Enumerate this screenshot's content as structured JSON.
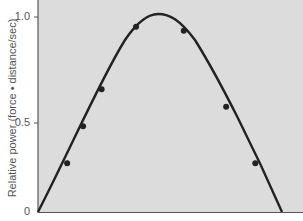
{
  "chart_data": {
    "type": "line",
    "title": "",
    "xlabel": "",
    "ylabel": "Relative power (force • distance/sec)",
    "ylim": [
      0,
      1.0
    ],
    "yticks": [
      "0",
      "0.5",
      "1.0"
    ],
    "grid": false,
    "legend": null,
    "background": "#dcdcdc",
    "series": [
      {
        "name": "fitted curve",
        "style": "line",
        "description": "inverted-U curve rising from 0 at left axis, peaking at ~1.0 near middle, falling to 0 near right"
      },
      {
        "name": "measured points",
        "style": "scatter",
        "points": [
          {
            "x": 0.11,
            "y": 0.25
          },
          {
            "x": 0.17,
            "y": 0.44
          },
          {
            "x": 0.24,
            "y": 0.63
          },
          {
            "x": 0.37,
            "y": 0.95
          },
          {
            "x": 0.55,
            "y": 0.93
          },
          {
            "x": 0.71,
            "y": 0.54
          },
          {
            "x": 0.82,
            "y": 0.25
          }
        ]
      }
    ]
  }
}
